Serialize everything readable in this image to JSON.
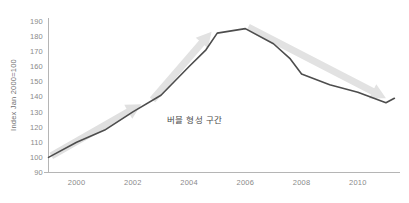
{
  "chart_data": {
    "type": "line",
    "title": "",
    "subtitle": "",
    "xlabel": "",
    "ylabel": "Index Jan 2000=100",
    "xlim": [
      1999,
      2011.5
    ],
    "ylim": [
      90,
      192
    ],
    "grid": false,
    "legend": null,
    "x_tick_labels": [
      "2000",
      "2002",
      "2004",
      "2006",
      "2008",
      "2010"
    ],
    "x_tick_values": [
      2000,
      2002,
      2004,
      2006,
      2008,
      2010
    ],
    "y_tick_labels": [
      "90",
      "100",
      "110",
      "120",
      "130",
      "140",
      "150",
      "160",
      "170",
      "180",
      "190"
    ],
    "y_tick_values": [
      90,
      100,
      110,
      120,
      130,
      140,
      150,
      160,
      170,
      180,
      190
    ],
    "series": [
      {
        "name": "Index",
        "color": "#4d4d4d",
        "x": [
          1999.0,
          2000.0,
          2001.0,
          2002.0,
          2003.0,
          2004.0,
          2004.6,
          2005.0,
          2006.0,
          2007.0,
          2007.6,
          2008.0,
          2009.0,
          2010.0,
          2011.0,
          2011.3
        ],
        "values": [
          100,
          110,
          118,
          130,
          141,
          160,
          171,
          182,
          185,
          175,
          165,
          155,
          148,
          143,
          136,
          139
        ]
      }
    ],
    "annotations": [
      {
        "name": "bubble-zone-label",
        "text": "버블 형성 구간",
        "x": 2004.2,
        "y": 123,
        "color": "#4a4a4a"
      },
      {
        "name": "rise-arrow-lower",
        "kind": "arrow",
        "direction": "up-right",
        "color": "#e0e0e0",
        "from": [
          1999.1,
          101
        ],
        "to": [
          2002.3,
          135
        ]
      },
      {
        "name": "rise-arrow-upper",
        "kind": "arrow",
        "direction": "up-right",
        "color": "#e2e2e2",
        "from": [
          2002.7,
          138
        ],
        "to": [
          2004.8,
          183
        ]
      },
      {
        "name": "decline-arrow",
        "kind": "arrow",
        "direction": "down-right",
        "color": "#e2e2e2",
        "from": [
          2006.1,
          186
        ],
        "to": [
          2011.0,
          139
        ]
      }
    ],
    "axis_color": "#b5b5b5",
    "text_color": "#8a8a8a",
    "background": "#ffffff"
  }
}
